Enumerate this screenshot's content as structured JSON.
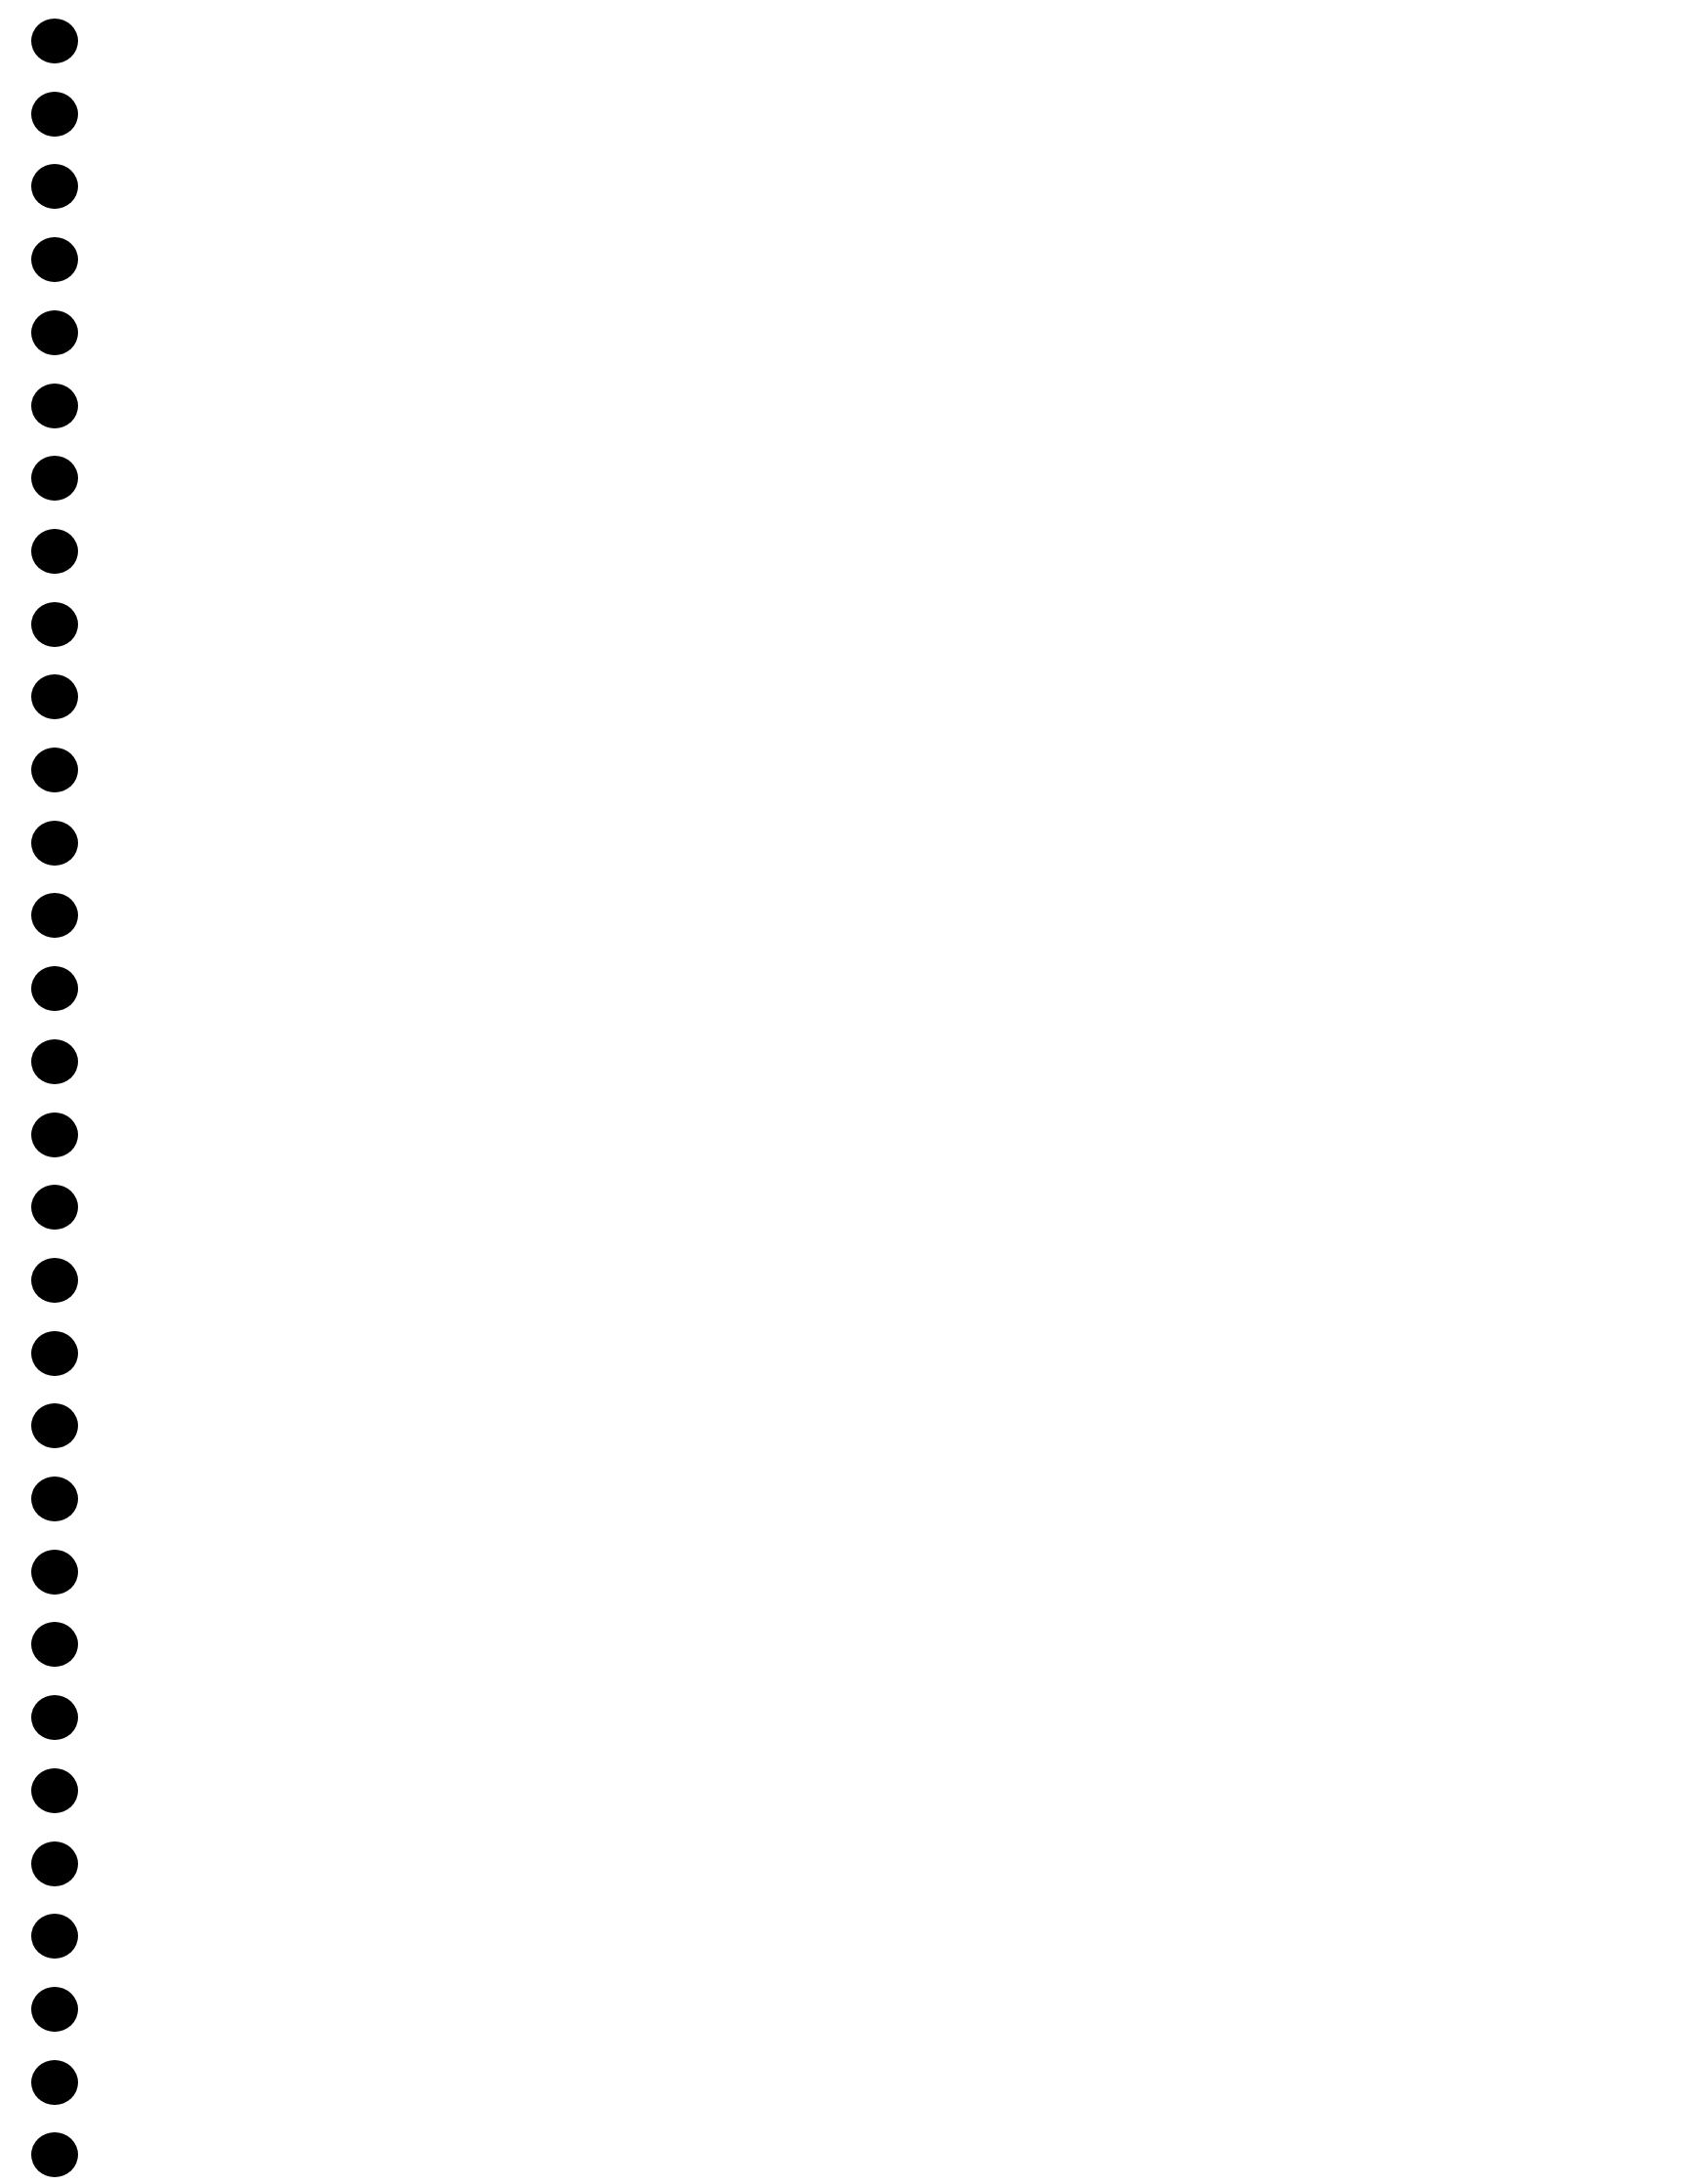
{
  "page": {
    "type": "blank-notebook-page",
    "background_color": "#ffffff",
    "content_text": ""
  },
  "binder_holes": {
    "count": 30,
    "color": "#000000",
    "center_x": 56,
    "first_center_y": 42,
    "spacing_y": 74.7,
    "diameter": 48
  }
}
